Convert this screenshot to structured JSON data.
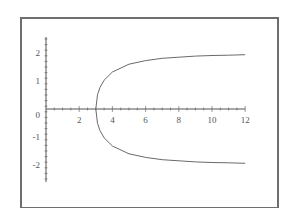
{
  "chart_data": {
    "type": "line",
    "title": "",
    "xlabel": "",
    "ylabel": "",
    "xlim": [
      0,
      12
    ],
    "ylim": [
      -2.5,
      2.5
    ],
    "grid": false,
    "legend": null,
    "x_ticks": [
      "2",
      "4",
      "6",
      "8",
      "10",
      "12"
    ],
    "y_ticks": [
      "2",
      "1",
      "0",
      "-1",
      "-2"
    ],
    "series": [
      {
        "name": "upper branch",
        "x": [
          3,
          3.1,
          3.25,
          3.5,
          4,
          5,
          6,
          7,
          8,
          9,
          10,
          11,
          12
        ],
        "y": [
          0,
          0.51,
          0.77,
          1.03,
          1.32,
          1.6,
          1.73,
          1.81,
          1.85,
          1.89,
          1.91,
          1.92,
          1.94
        ]
      },
      {
        "name": "lower branch",
        "x": [
          3,
          3.1,
          3.25,
          3.5,
          4,
          5,
          6,
          7,
          8,
          9,
          10,
          11,
          12
        ],
        "y": [
          0,
          -0.51,
          -0.77,
          -1.03,
          -1.32,
          -1.6,
          -1.73,
          -1.81,
          -1.85,
          -1.89,
          -1.91,
          -1.92,
          -1.94
        ]
      }
    ],
    "annotations": []
  },
  "style": {
    "axis_color": "#555555",
    "curve_color": "#6a6a6a",
    "frame_color": "#6e6e6e"
  }
}
